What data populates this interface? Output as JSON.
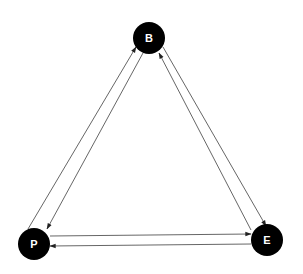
{
  "diagram": {
    "type": "directed-graph",
    "colors": {
      "node_fill": "#000000",
      "node_text": "#ffffff",
      "edge": "#555555",
      "background": "#ffffff"
    },
    "nodes": [
      {
        "id": "B",
        "label": "B",
        "x": 149,
        "y": 38,
        "r": 16
      },
      {
        "id": "P",
        "label": "P",
        "x": 34,
        "y": 244,
        "r": 16
      },
      {
        "id": "E",
        "label": "E",
        "x": 267,
        "y": 240,
        "r": 16
      }
    ],
    "edges": [
      {
        "from": "P",
        "to": "B",
        "x1": 28,
        "y1": 229,
        "x2": 136,
        "y2": 47
      },
      {
        "from": "B",
        "to": "P",
        "x1": 143,
        "y1": 53,
        "x2": 47,
        "y2": 229
      },
      {
        "from": "E",
        "to": "B",
        "x1": 251,
        "y1": 230,
        "x2": 159,
        "y2": 53
      },
      {
        "from": "B",
        "to": "E",
        "x1": 163,
        "y1": 47,
        "x2": 266,
        "y2": 226
      },
      {
        "from": "P",
        "to": "E",
        "x1": 50,
        "y1": 236,
        "x2": 251,
        "y2": 234
      },
      {
        "from": "E",
        "to": "P",
        "x1": 251,
        "y1": 244,
        "x2": 50,
        "y2": 246
      }
    ]
  }
}
